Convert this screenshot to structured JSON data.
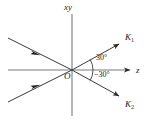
{
  "figure": {
    "axes": {
      "vertical_label": "xy",
      "horizontal_label": "z",
      "origin_label": "O"
    },
    "rays": [
      {
        "name": "K1",
        "label": "K",
        "subscript": "1",
        "angle_deg": 30,
        "direction": "outgoing-upper-right"
      },
      {
        "name": "K2",
        "label": "K",
        "subscript": "2",
        "angle_deg": -30,
        "direction": "outgoing-lower-right"
      },
      {
        "name": "incident-upper",
        "angle_deg": 30,
        "direction": "incoming-from-upper-left"
      },
      {
        "name": "incident-lower",
        "angle_deg": -30,
        "direction": "incoming-from-lower-left"
      }
    ],
    "angle_annotations": [
      {
        "name": "angle-positive",
        "text": "30°"
      },
      {
        "name": "angle-negative",
        "text": "−30°"
      }
    ],
    "colors": {
      "stroke": "#2b2b2b",
      "axis": "#6e6e6e",
      "text": "#1a1a1a",
      "background": "#ffffff"
    }
  }
}
